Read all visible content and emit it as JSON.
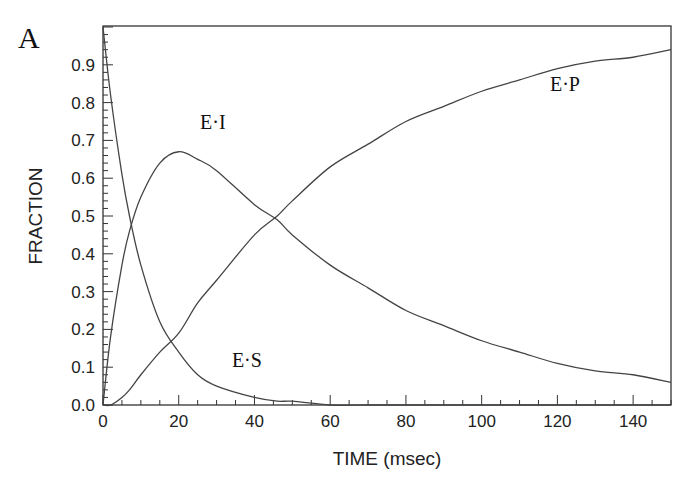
{
  "panel_label": "A",
  "chart_data": {
    "type": "line",
    "title": "",
    "xlabel": "TIME (msec)",
    "ylabel": "FRACTION",
    "xlim": [
      0,
      150
    ],
    "ylim": [
      0,
      1.0
    ],
    "x_ticks": [
      0,
      20,
      40,
      60,
      80,
      100,
      120,
      140
    ],
    "x_tick_labels": [
      "0",
      "20",
      "40",
      "60",
      "80",
      "100",
      "120",
      "140"
    ],
    "y_ticks": [
      0.0,
      0.1,
      0.2,
      0.3,
      0.4,
      0.5,
      0.6,
      0.7,
      0.8,
      0.9
    ],
    "y_tick_labels": [
      "0.0",
      "0.1",
      "0.2",
      "0.3",
      "0.4",
      "0.5",
      "0.6",
      "0.7",
      "0.8",
      "0.9"
    ],
    "grid": false,
    "legend": "inline labels",
    "x": [
      0,
      2,
      5,
      7,
      10,
      15,
      20,
      25,
      30,
      40,
      46,
      50,
      60,
      70,
      80,
      90,
      100,
      110,
      120,
      130,
      140,
      150
    ],
    "series": [
      {
        "name": "E·S",
        "values": [
          1.0,
          0.82,
          0.61,
          0.5,
          0.37,
          0.22,
          0.14,
          0.08,
          0.05,
          0.02,
          0.01,
          0.01,
          0.0,
          0.0,
          0.0,
          0.0,
          0.0,
          0.0,
          0.0,
          0.0,
          0.0,
          0.0
        ]
      },
      {
        "name": "E·I",
        "values": [
          0.0,
          0.18,
          0.37,
          0.46,
          0.55,
          0.64,
          0.67,
          0.65,
          0.62,
          0.53,
          0.49,
          0.45,
          0.37,
          0.31,
          0.25,
          0.21,
          0.17,
          0.14,
          0.11,
          0.09,
          0.08,
          0.06
        ]
      },
      {
        "name": "E·P",
        "values": [
          0.0,
          0.0,
          0.02,
          0.04,
          0.08,
          0.14,
          0.19,
          0.27,
          0.33,
          0.45,
          0.5,
          0.54,
          0.63,
          0.69,
          0.75,
          0.79,
          0.83,
          0.86,
          0.89,
          0.91,
          0.92,
          0.94
        ]
      }
    ],
    "annotations": [
      {
        "text": "E·I",
        "x": 29,
        "y": 0.73
      },
      {
        "text": "E·P",
        "x": 122,
        "y": 0.83
      },
      {
        "text": "E·S",
        "x": 38,
        "y": 0.1
      }
    ]
  }
}
